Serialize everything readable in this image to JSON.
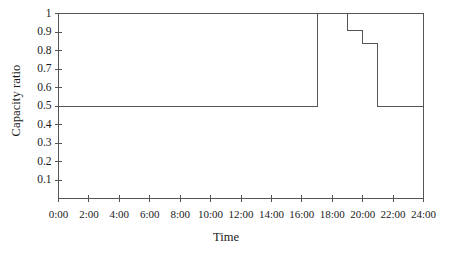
{
  "chart_data": {
    "type": "line",
    "title": "",
    "subtitle": "",
    "xlabel": "Time",
    "ylabel": "Capacity ratio",
    "step": "post",
    "grid": false,
    "legend": null,
    "xlim": [
      0,
      24
    ],
    "ylim": [
      0,
      1
    ],
    "xtick_values": [
      0,
      2,
      4,
      6,
      8,
      10,
      12,
      14,
      16,
      18,
      20,
      22,
      24
    ],
    "xtick_labels": [
      "0:00",
      "2:00",
      "4:00",
      "6:00",
      "8:00",
      "10:00",
      "12:00",
      "14:00",
      "16:00",
      "18:00",
      "20:00",
      "22:00",
      "24:00"
    ],
    "ytick_values": [
      0.1,
      0.2,
      0.3,
      0.4,
      0.5,
      0.6,
      0.7,
      0.8,
      0.9,
      1
    ],
    "ytick_labels": [
      "0.1",
      "0.2",
      "0.3",
      "0.4",
      "0.5",
      "0.6",
      "0.7",
      "0.8",
      "0.9",
      "1"
    ],
    "line_color": "#555555",
    "line_width": 1,
    "series": [
      {
        "name": "Capacity ratio",
        "x": [
          0,
          17,
          17,
          19,
          19,
          20,
          20,
          21,
          21,
          24
        ],
        "values": [
          0.5,
          0.5,
          1.0,
          1.0,
          0.91,
          0.91,
          0.84,
          0.84,
          0.5,
          0.5
        ]
      }
    ],
    "step_points": [
      {
        "time": "0:00",
        "x": 0,
        "value": 0.5
      },
      {
        "time": "17:00",
        "x": 17,
        "value": 1.0
      },
      {
        "time": "19:00",
        "x": 19,
        "value": 0.91
      },
      {
        "time": "20:00",
        "x": 20,
        "value": 0.84
      },
      {
        "time": "21:00",
        "x": 21,
        "value": 0.5
      },
      {
        "time": "24:00",
        "x": 24,
        "value": 0.5
      }
    ]
  }
}
